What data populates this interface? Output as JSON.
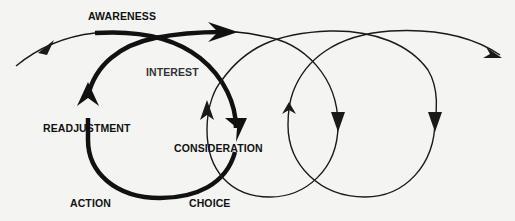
{
  "diagram": {
    "type": "cyclical process spiral",
    "stages": [
      {
        "id": "awareness",
        "label": "AWARENESS"
      },
      {
        "id": "interest",
        "label": "INTEREST"
      },
      {
        "id": "consideration",
        "label": "CONSIDERATION"
      },
      {
        "id": "choice",
        "label": "CHOICE"
      },
      {
        "id": "action",
        "label": "ACTION"
      },
      {
        "id": "readjustment",
        "label": "READJUSTMENT"
      }
    ],
    "loops": [
      {
        "name": "first-cycle",
        "style": "thick",
        "color": "#111111"
      },
      {
        "name": "second-cycle",
        "style": "thin",
        "color": "#222222"
      },
      {
        "name": "third-cycle",
        "style": "thin",
        "color": "#222222"
      }
    ],
    "background": "#f4f4f2"
  }
}
